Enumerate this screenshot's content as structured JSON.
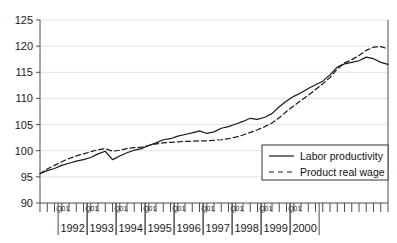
{
  "chart_data": {
    "type": "line",
    "title": "",
    "xlabel": "",
    "ylabel": "",
    "ylim": [
      90,
      125
    ],
    "ytick_labels": [
      "90",
      "95",
      "100",
      "105",
      "110",
      "115",
      "120",
      "125"
    ],
    "ytick_values": [
      90,
      95,
      100,
      105,
      110,
      115,
      120,
      125
    ],
    "grid": true,
    "grid_axis": "y",
    "legend_position": "lower-right",
    "quarter_tick_label": "Q01",
    "year_labels": [
      "1992",
      "1993",
      "1994",
      "1995",
      "1996",
      "1997",
      "1998",
      "1999",
      "2000"
    ],
    "x_unit": "quarter",
    "x_start": "1991Q2",
    "x_end": "2001Q2",
    "colors": {
      "line": "#1a1a1a",
      "grid": "#e2e2e2",
      "axis": "#4d4d4d",
      "background": "#ffffff"
    },
    "series": [
      {
        "name": "Labor productivity",
        "style": "solid",
        "values": [
          95.6,
          96.2,
          96.6,
          97.2,
          97.6,
          98.0,
          98.3,
          98.7,
          99.4,
          99.9,
          98.3,
          99.0,
          99.6,
          100.1,
          100.4,
          101.0,
          101.5,
          102.1,
          102.3,
          102.8,
          103.1,
          103.4,
          103.8,
          103.3,
          103.6,
          104.3,
          104.6,
          105.1,
          105.6,
          106.2,
          106.0,
          106.4,
          107.1,
          108.4,
          109.5,
          110.4,
          111.1,
          111.9,
          112.6,
          113.3,
          114.5,
          116.0,
          116.6,
          116.9,
          117.2,
          117.9,
          117.6,
          116.9,
          116.5
        ]
      },
      {
        "name": "Product real wage",
        "style": "dashed",
        "values": [
          95.6,
          96.5,
          97.2,
          97.9,
          98.5,
          99.0,
          99.4,
          99.8,
          100.2,
          100.4,
          99.9,
          100.1,
          100.4,
          100.6,
          100.7,
          101.0,
          101.3,
          101.5,
          101.6,
          101.7,
          101.8,
          101.8,
          101.9,
          101.9,
          102.0,
          102.1,
          102.3,
          102.6,
          103.0,
          103.5,
          104.0,
          104.6,
          105.3,
          106.3,
          107.5,
          108.6,
          109.6,
          110.6,
          111.7,
          112.8,
          114.0,
          115.6,
          116.8,
          117.4,
          118.2,
          119.2,
          119.8,
          119.9,
          119.5
        ]
      }
    ]
  },
  "legend": {
    "items": [
      {
        "label": "Labor productivity",
        "style": "solid"
      },
      {
        "label": "Product real wage",
        "style": "dashed"
      }
    ]
  }
}
